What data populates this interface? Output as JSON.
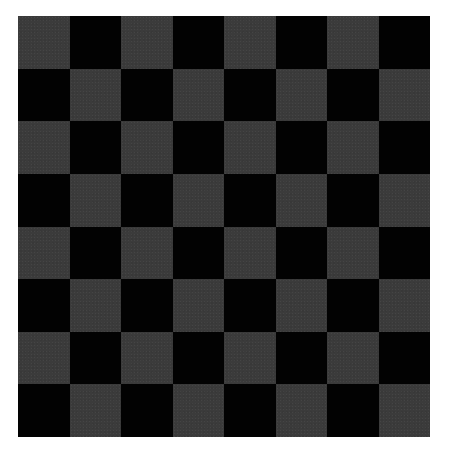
{
  "board": {
    "rows": 8,
    "cols": 8,
    "top_left_color": "light",
    "colors": {
      "light": "#3b3b3b",
      "dark": "#020202",
      "background": "#ffffff"
    },
    "pieces": []
  }
}
